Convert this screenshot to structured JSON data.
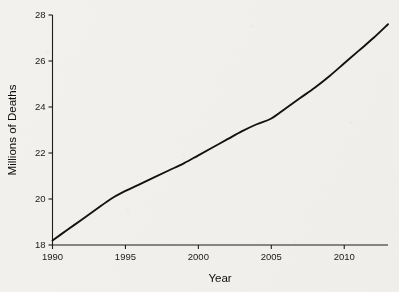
{
  "chart_data": {
    "type": "line",
    "title": "",
    "xlabel": "Year",
    "ylabel": "Millions of Deaths",
    "xlim": [
      1990,
      2013
    ],
    "ylim": [
      18,
      28
    ],
    "grid": false,
    "legend": "none",
    "xticks": [
      1990,
      1995,
      2000,
      2005,
      2010
    ],
    "xtick_labels": [
      "1990",
      "1995",
      "2000",
      "2005",
      "2010"
    ],
    "yticks": [
      18,
      20,
      22,
      24,
      26,
      28
    ],
    "ytick_labels": [
      "18",
      "20",
      "22",
      "24",
      "26",
      "28"
    ],
    "line_color": "#121212",
    "background_color": "#f2f1ee",
    "series": [
      {
        "name": "Global deaths",
        "x": [
          1990,
          1991,
          1992,
          1993,
          1994,
          1995,
          1996,
          1997,
          1998,
          1999,
          2000,
          2001,
          2002,
          2003,
          2004,
          2005,
          2006,
          2007,
          2008,
          2009,
          2010,
          2011,
          2012,
          2013
        ],
        "values": [
          18.2,
          18.65,
          19.1,
          19.55,
          20.0,
          20.35,
          20.65,
          20.95,
          21.25,
          21.55,
          21.9,
          22.25,
          22.6,
          22.95,
          23.25,
          23.5,
          23.95,
          24.4,
          24.85,
          25.35,
          25.9,
          26.45,
          27.0,
          27.6
        ]
      }
    ]
  },
  "axis_titles": {
    "x": "Year",
    "y": "Millions of Deaths"
  }
}
